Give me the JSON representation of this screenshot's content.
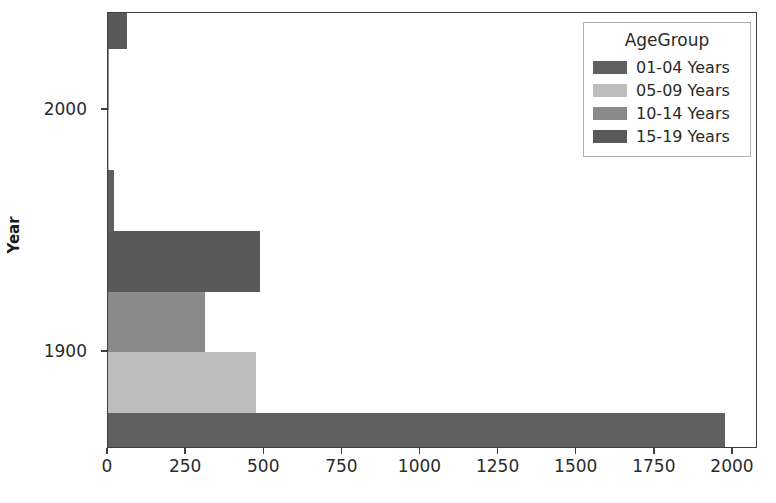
{
  "chart_data": {
    "type": "bar",
    "orientation": "horizontal",
    "title": "",
    "xlabel": "",
    "ylabel": "Year",
    "xlim": [
      0,
      2080
    ],
    "ylim": [
      1860,
      2040
    ],
    "xticks": [
      0,
      250,
      500,
      750,
      1000,
      1250,
      1500,
      1750,
      2000
    ],
    "xtick_labels": [
      "0",
      "250",
      "500",
      "750",
      "1000",
      "1250",
      "1500",
      "1750",
      "2000"
    ],
    "yticks": [
      1900,
      2000
    ],
    "ytick_labels": [
      "1900",
      "2000"
    ],
    "grid": false,
    "legend": {
      "title": "AgeGroup",
      "position": "upper right",
      "entries": [
        "01-04 Years",
        "05-09 Years",
        "10-14 Years",
        "15-19 Years"
      ]
    },
    "categories": [
      "1900",
      "2000"
    ],
    "series": [
      {
        "name": "01-04 Years",
        "color": "#606060",
        "values": [
          1975,
          20
        ]
      },
      {
        "name": "05-09 Years",
        "color": "#bdbdbd",
        "values": [
          475,
          1
        ]
      },
      {
        "name": "10-14 Years",
        "color": "#8a8a8a",
        "values": [
          310,
          3
        ]
      },
      {
        "name": "15-19 Years",
        "color": "#595959",
        "values": [
          487,
          60
        ]
      }
    ]
  },
  "colors": {
    "axis": "#3f3f3f",
    "text": "#2b2b2b",
    "background": "#ffffff",
    "legend_border": "#b0b0b0"
  }
}
